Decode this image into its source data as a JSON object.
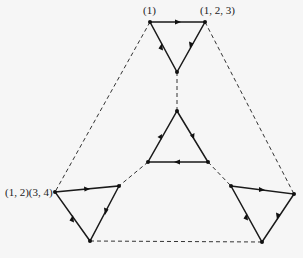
{
  "diagram": {
    "labels": {
      "identity": "(1)",
      "three_cycle": "(1, 2, 3)",
      "double_transposition": "(1, 2)(3, 4)"
    },
    "triangles": [
      {
        "name": "top",
        "vertices": [
          [
            150,
            22
          ],
          [
            205,
            22
          ],
          [
            177,
            72
          ]
        ]
      },
      {
        "name": "middle",
        "vertices": [
          [
            177,
            111
          ],
          [
            208,
            162
          ],
          [
            148,
            162
          ]
        ]
      },
      {
        "name": "left",
        "vertices": [
          [
            55,
            192
          ],
          [
            119,
            186
          ],
          [
            90,
            241
          ]
        ]
      },
      {
        "name": "right",
        "vertices": [
          [
            231,
            186
          ],
          [
            294,
            194
          ],
          [
            262,
            242
          ]
        ]
      }
    ],
    "dashed_edges": [
      [
        [
          150,
          22
        ],
        [
          55,
          192
        ]
      ],
      [
        [
          205,
          22
        ],
        [
          294,
          194
        ]
      ],
      [
        [
          177,
          72
        ],
        [
          177,
          111
        ]
      ],
      [
        [
          148,
          162
        ],
        [
          119,
          186
        ]
      ],
      [
        [
          208,
          162
        ],
        [
          231,
          186
        ]
      ],
      [
        [
          90,
          241
        ],
        [
          262,
          242
        ]
      ]
    ],
    "colors": {
      "background": "#f6f6f6",
      "lines": "#1a1a1a"
    }
  }
}
